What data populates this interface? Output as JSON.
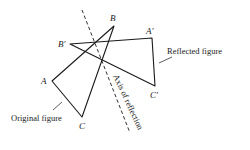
{
  "figure": {
    "original": {
      "name": "Original figure",
      "vertices": {
        "A": [
          52,
          81
        ],
        "B": [
          114,
          26
        ],
        "C": [
          82,
          117
        ]
      },
      "labels": {
        "A": "A",
        "B": "B",
        "C": "C"
      }
    },
    "reflected": {
      "name": "Reflected figure",
      "vertices": {
        "A_prime": [
          152,
          38
        ],
        "B_prime": [
          70,
          44
        ],
        "C_prime": [
          155,
          86
        ]
      },
      "labels": {
        "A_prime": "A′",
        "B_prime": "B′",
        "C_prime": "C′"
      }
    },
    "axis": {
      "label": "Axis of reflection",
      "style": "dashed",
      "from": [
        82,
        10
      ],
      "to": [
        130,
        133
      ]
    },
    "captions": {
      "original": "Original figure",
      "reflected": "Reflected figure"
    },
    "colors": {
      "line": "#1a1a1a",
      "background": "#ffffff"
    }
  }
}
